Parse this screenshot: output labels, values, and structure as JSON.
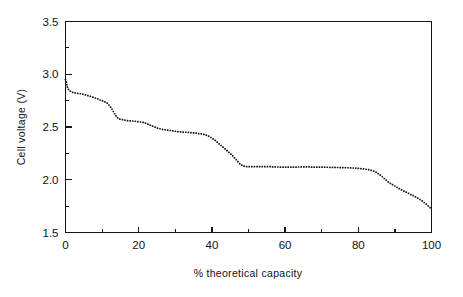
{
  "chart_data": {
    "type": "scatter",
    "title": "",
    "subtitle": "",
    "xlabel": "% theoretical capacity",
    "ylabel": "Cell voltage (V)",
    "xlim": [
      0,
      100
    ],
    "ylim": [
      1.5,
      3.5
    ],
    "x_major_ticks": [
      0,
      20,
      40,
      60,
      80,
      100
    ],
    "x_minor_ticks": [
      10,
      30,
      50,
      70,
      90
    ],
    "y_major_ticks": [
      1.5,
      2.0,
      2.5,
      3.0,
      3.5
    ],
    "y_minor_ticks": [
      1.75,
      2.25,
      2.75,
      3.25
    ],
    "x_tick_labels": [
      "0",
      "20",
      "40",
      "60",
      "80",
      "100"
    ],
    "y_tick_labels": [
      "1.5",
      "2.0",
      "2.5",
      "3.0",
      "3.5"
    ],
    "grid": false,
    "legend": null,
    "marker": "dot",
    "marker_color": "#111111",
    "annotations": [],
    "series": [
      {
        "name": "discharge curve",
        "x": [
          0.0,
          0.3,
          0.6,
          0.9,
          1.3,
          1.8,
          2.4,
          3.2,
          4.1,
          5.0,
          5.9,
          6.8,
          7.7,
          8.6,
          9.5,
          10.3,
          11.0,
          11.6,
          12.1,
          12.6,
          13.1,
          13.6,
          14.1,
          14.7,
          15.4,
          16.2,
          17.1,
          18.0,
          19.0,
          20.0,
          21.0,
          22.0,
          23.0,
          24.0,
          25.0,
          26.0,
          27.0,
          28.0,
          29.0,
          30.0,
          31.0,
          32.0,
          33.0,
          34.0,
          35.0,
          36.0,
          37.0,
          38.0,
          39.0,
          40.0,
          41.0,
          42.0,
          43.0,
          44.0,
          45.0,
          46.0,
          47.0,
          47.8,
          48.5,
          49.5,
          51.0,
          52.5,
          54.0,
          55.5,
          57.0,
          58.5,
          60.0,
          61.5,
          63.0,
          64.5,
          66.0,
          67.5,
          69.0,
          70.5,
          72.0,
          73.5,
          75.0,
          76.5,
          78.0,
          79.5,
          81.0,
          82.0,
          83.0,
          84.0,
          85.0,
          85.8,
          86.5,
          87.3,
          88.0,
          89.0,
          90.0,
          91.0,
          92.0,
          93.0,
          94.0,
          95.0,
          96.0,
          97.0,
          98.0,
          99.0,
          100.0
        ],
        "y": [
          2.95,
          2.91,
          2.87,
          2.85,
          2.84,
          2.83,
          2.825,
          2.82,
          2.815,
          2.81,
          2.8,
          2.79,
          2.78,
          2.77,
          2.755,
          2.745,
          2.735,
          2.72,
          2.7,
          2.675,
          2.645,
          2.615,
          2.59,
          2.575,
          2.57,
          2.565,
          2.56,
          2.558,
          2.555,
          2.55,
          2.545,
          2.535,
          2.52,
          2.505,
          2.49,
          2.482,
          2.475,
          2.47,
          2.465,
          2.46,
          2.455,
          2.452,
          2.45,
          2.447,
          2.445,
          2.44,
          2.435,
          2.43,
          2.415,
          2.395,
          2.37,
          2.34,
          2.31,
          2.28,
          2.25,
          2.215,
          2.175,
          2.145,
          2.13,
          2.125,
          2.125,
          2.125,
          2.125,
          2.125,
          2.122,
          2.12,
          2.12,
          2.12,
          2.12,
          2.122,
          2.122,
          2.12,
          2.12,
          2.12,
          2.118,
          2.118,
          2.115,
          2.115,
          2.112,
          2.11,
          2.105,
          2.1,
          2.095,
          2.085,
          2.07,
          2.05,
          2.03,
          2.005,
          1.985,
          1.96,
          1.94,
          1.92,
          1.9,
          1.885,
          1.865,
          1.85,
          1.83,
          1.81,
          1.785,
          1.755,
          1.725
        ]
      }
    ]
  }
}
